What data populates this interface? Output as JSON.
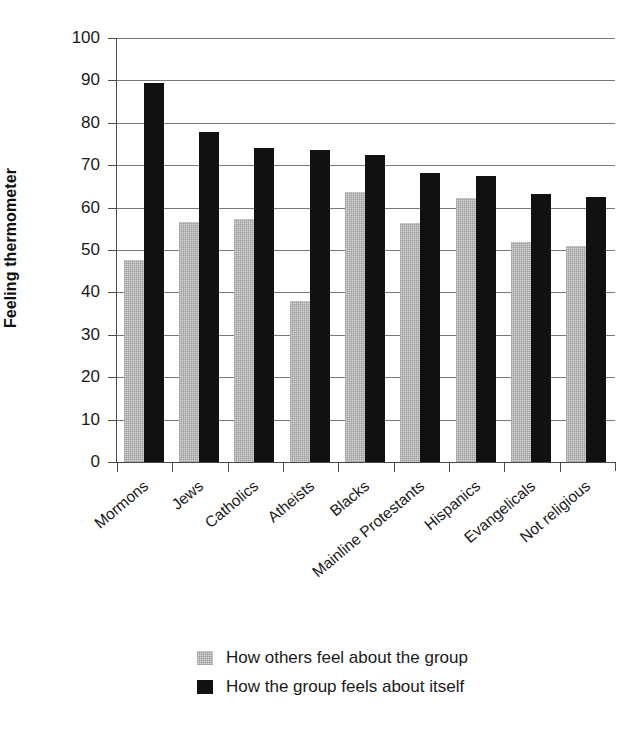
{
  "chart_data": {
    "type": "bar",
    "title": "",
    "xlabel": "",
    "ylabel": "Feeling thermometer",
    "ylim": [
      0,
      100
    ],
    "ytick_step": 10,
    "yticks": [
      0,
      10,
      20,
      30,
      40,
      50,
      60,
      70,
      80,
      90,
      100
    ],
    "ytick_labels": [
      "0",
      "10",
      "20",
      "30",
      "40",
      "50",
      "60",
      "70",
      "80",
      "90",
      "100"
    ],
    "grid": "horizontal",
    "legend_position": "bottom-center",
    "categories": [
      "Mormons",
      "Jews",
      "Catholics",
      "Atheists",
      "Blacks",
      "Mainline Protestants",
      "Hispanics",
      "Evangelicals",
      "Not religious"
    ],
    "series": [
      {
        "name": "How others feel about the group",
        "color": "#d6d6d6",
        "values": [
          47.6,
          56.5,
          57.4,
          38.0,
          63.8,
          56.4,
          62.2,
          52.0,
          51.0
        ]
      },
      {
        "name": "How the group feels about itself",
        "color": "#111111",
        "values": [
          89.5,
          77.8,
          74.1,
          73.6,
          72.5,
          68.1,
          67.4,
          63.3,
          62.4
        ]
      }
    ]
  },
  "legend": {
    "items": [
      {
        "label": "How others feel about the group",
        "swatch": "others"
      },
      {
        "label": "How the group feels about itself",
        "swatch": "self"
      }
    ]
  }
}
